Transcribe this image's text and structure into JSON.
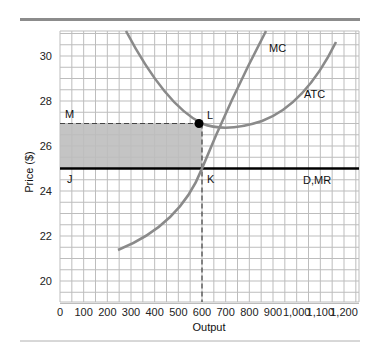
{
  "chart_data": {
    "type": "line",
    "title": "",
    "xlabel": "Output",
    "ylabel": "Price ($)",
    "xlim": [
      0,
      1300
    ],
    "ylim": [
      19,
      31.1
    ],
    "grid": true,
    "x_ticks": [
      "0",
      "100",
      "200",
      "300",
      "400",
      "500",
      "600",
      "700",
      "800",
      "900",
      "1,000",
      "1,100",
      "1,200"
    ],
    "y_ticks": [
      "20",
      "22",
      "24",
      "26",
      "28",
      "30"
    ],
    "series": [
      {
        "name": "MC",
        "points": [
          [
            245,
            21.4
          ],
          [
            350,
            22.1
          ],
          [
            450,
            23.0
          ],
          [
            550,
            24.1
          ],
          [
            600,
            25.0
          ],
          [
            650,
            26.0
          ],
          [
            700,
            27.1
          ],
          [
            750,
            28.5
          ],
          [
            800,
            30.0
          ],
          [
            870,
            31.1
          ]
        ]
      },
      {
        "name": "ATC",
        "points": [
          [
            300,
            31.1
          ],
          [
            400,
            29.5
          ],
          [
            500,
            28.1
          ],
          [
            600,
            27.0
          ],
          [
            700,
            26.75
          ],
          [
            800,
            26.9
          ],
          [
            900,
            27.5
          ],
          [
            1000,
            28.4
          ],
          [
            1100,
            29.6
          ],
          [
            1170,
            30.6
          ]
        ]
      },
      {
        "name": "D,MR",
        "points": [
          [
            0,
            25
          ],
          [
            1300,
            25
          ]
        ]
      }
    ],
    "annotations": [
      {
        "text": "M",
        "x": 0,
        "y": 27
      },
      {
        "text": "L",
        "x": 600,
        "y": 27
      },
      {
        "text": "J",
        "x": 0,
        "y": 25
      },
      {
        "text": "K",
        "x": 600,
        "y": 25
      },
      {
        "text": "MC",
        "x": 880,
        "y": 30.3
      },
      {
        "text": "ATC",
        "x": 1000,
        "y": 28.2
      },
      {
        "text": "D,MR",
        "x": 1080,
        "y": 24.5
      }
    ],
    "shaded_region": {
      "x": [
        0,
        600
      ],
      "y": [
        25,
        27
      ],
      "meaning": "economic profit"
    },
    "profit_max_output": 600,
    "price": 25,
    "atc_at_output": 27
  },
  "colors": {
    "curve": "#8a8a8a",
    "demand_line": "#000000",
    "shade": "#c4c4c4",
    "grid": "#bdbdbd",
    "rule": "#8c8c8c"
  }
}
